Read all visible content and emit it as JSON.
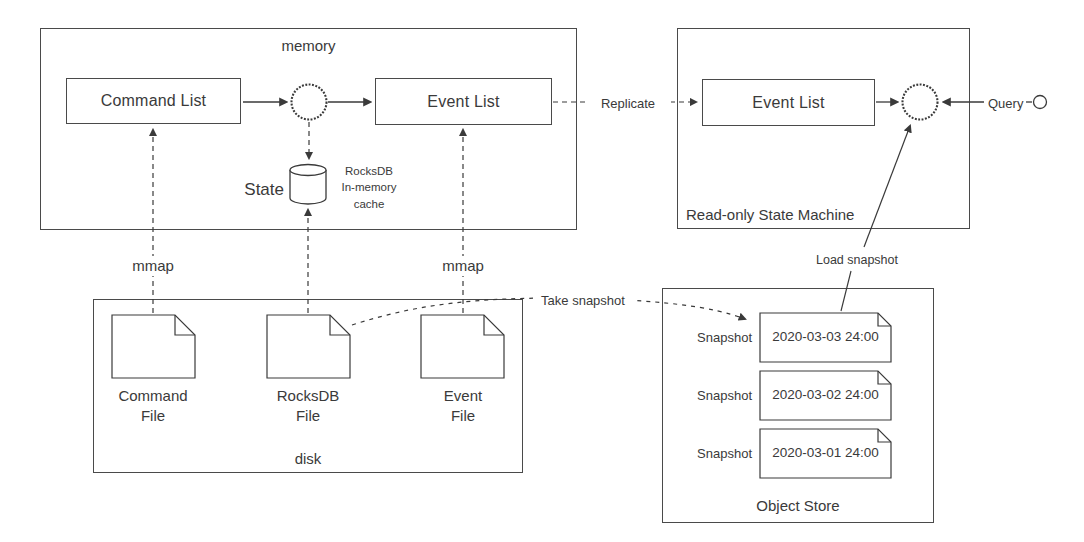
{
  "colors": {
    "ink": "#3a3a3a",
    "border": "#4a4a4a",
    "background": "#ffffff"
  },
  "memory": {
    "title": "memory",
    "command_list_label": "Command List",
    "event_list_label": "Event List",
    "state_label": "State",
    "state_cache_note": "RocksDB\nIn-memory\ncache"
  },
  "read_only_machine": {
    "title": "Read-only State Machine",
    "event_list_label": "Event List",
    "query_label": "Query"
  },
  "disk": {
    "title": "disk",
    "mmap_left_label": "mmap",
    "mmap_right_label": "mmap",
    "files": [
      {
        "label": "Command\nFile"
      },
      {
        "label": "RocksDB\nFile"
      },
      {
        "label": "Event\nFile"
      }
    ]
  },
  "object_store": {
    "title": "Object Store",
    "snapshots": [
      {
        "label": "Snapshot",
        "timestamp": "2020-03-03 24:00"
      },
      {
        "label": "Snapshot",
        "timestamp": "2020-03-02 24:00"
      },
      {
        "label": "Snapshot",
        "timestamp": "2020-03-01 24:00"
      }
    ]
  },
  "edges": {
    "replicate_label": "Replicate",
    "take_snapshot_label": "Take snapshot",
    "load_snapshot_label": "Load snapshot"
  }
}
